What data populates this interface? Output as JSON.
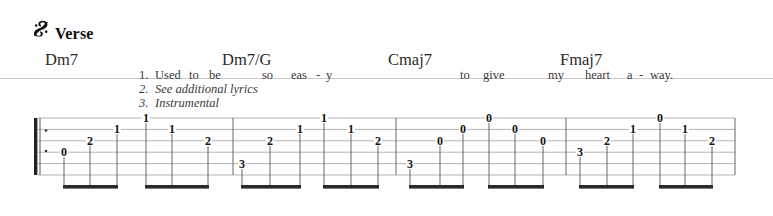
{
  "header": {
    "segno_icon": "segno-sign",
    "segno_glyph": "§",
    "section_label": "Verse"
  },
  "chords": [
    {
      "name": "Dm7",
      "x": 45
    },
    {
      "name": "Dm7/G",
      "x": 222
    },
    {
      "name": "Cmaj7",
      "x": 388
    },
    {
      "name": "Fmaj7",
      "x": 560
    }
  ],
  "lyrics": {
    "lines": [
      {
        "number": "1.",
        "italic": false,
        "syllables": [
          {
            "text": "Used",
            "x": 16
          },
          {
            "text": "to",
            "x": 50
          },
          {
            "text": "be",
            "x": 70
          },
          {
            "text": "so",
            "x": 123
          },
          {
            "text": "eas",
            "x": 152
          },
          {
            "text": "-",
            "x": 177
          },
          {
            "text": "y",
            "x": 187
          },
          {
            "text": "to",
            "x": 321
          },
          {
            "text": "give",
            "x": 344
          },
          {
            "text": "my",
            "x": 409
          },
          {
            "text": "heart",
            "x": 446
          },
          {
            "text": "a",
            "x": 488
          },
          {
            "text": "-",
            "x": 500
          },
          {
            "text": "way.",
            "x": 511
          }
        ]
      },
      {
        "number": "2.",
        "italic": true,
        "syllables": [
          {
            "text": "See additional lyrics",
            "x": 16
          }
        ]
      },
      {
        "number": "3.",
        "italic": true,
        "syllables": [
          {
            "text": "Instrumental",
            "x": 16
          }
        ]
      }
    ]
  },
  "tab": {
    "staff": {
      "left": 38,
      "right": 735,
      "top": 118,
      "bottom": 175,
      "string_count": 6,
      "line_color": "#b4b4b4",
      "beam_y": 188,
      "beam_color": "#2a2a2a",
      "stem_color": "#555555"
    },
    "repeat_start": {
      "x": 38,
      "dots": 2
    },
    "barlines": [
      233,
      396,
      566,
      735
    ],
    "groups": [
      {
        "stem_top": 175,
        "notes": [
          {
            "fret": "0",
            "string": 4,
            "x": 64
          },
          {
            "fret": "2",
            "string": 3,
            "x": 90
          },
          {
            "fret": "1",
            "string": 2,
            "x": 117
          }
        ]
      },
      {
        "stem_top": 175,
        "notes": [
          {
            "fret": "1",
            "string": 1,
            "x": 146
          },
          {
            "fret": "1",
            "string": 2,
            "x": 172
          },
          {
            "fret": "2",
            "string": 3,
            "x": 208
          }
        ]
      },
      {
        "stem_top": 175,
        "notes": [
          {
            "fret": "3",
            "string": 5,
            "x": 242
          },
          {
            "fret": "2",
            "string": 3,
            "x": 270
          },
          {
            "fret": "1",
            "string": 2,
            "x": 300
          }
        ]
      },
      {
        "stem_top": 175,
        "notes": [
          {
            "fret": "1",
            "string": 1,
            "x": 324
          },
          {
            "fret": "1",
            "string": 2,
            "x": 351
          },
          {
            "fret": "2",
            "string": 3,
            "x": 378
          }
        ]
      },
      {
        "stem_top": 175,
        "notes": [
          {
            "fret": "3",
            "string": 5,
            "x": 410
          },
          {
            "fret": "0",
            "string": 3,
            "x": 440
          },
          {
            "fret": "0",
            "string": 2,
            "x": 463
          }
        ]
      },
      {
        "stem_top": 175,
        "notes": [
          {
            "fret": "0",
            "string": 1,
            "x": 489
          },
          {
            "fret": "0",
            "string": 2,
            "x": 515
          },
          {
            "fret": "0",
            "string": 3,
            "x": 543
          }
        ]
      },
      {
        "stem_top": 175,
        "notes": [
          {
            "fret": "3",
            "string": 4,
            "x": 580
          },
          {
            "fret": "2",
            "string": 3,
            "x": 607
          },
          {
            "fret": "1",
            "string": 2,
            "x": 633
          }
        ]
      },
      {
        "stem_top": 175,
        "notes": [
          {
            "fret": "0",
            "string": 1,
            "x": 660
          },
          {
            "fret": "1",
            "string": 2,
            "x": 685
          },
          {
            "fret": "2",
            "string": 3,
            "x": 712
          }
        ]
      }
    ]
  }
}
